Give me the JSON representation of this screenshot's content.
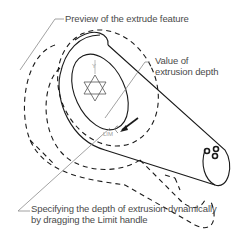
{
  "diagram": {
    "callouts": {
      "preview": "Preview of the extrude feature",
      "value_line1": "Value of",
      "value_line2": "extrusion depth",
      "specify_line1": "Specifying the depth of extrusion dynamically",
      "specify_line2": "by dragging the Limit handle"
    },
    "handle_label": "LIM",
    "colors": {
      "line": "#1a1a1a",
      "leader": "#8a8a8a",
      "text": "#4a4a4a"
    }
  }
}
